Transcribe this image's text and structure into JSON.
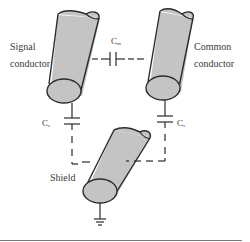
{
  "diagram": {
    "type": "shielded-conductor-capacitance",
    "components": {
      "signal_conductor": {
        "label_line1": "Signal",
        "label_line2": "conductor"
      },
      "common_conductor": {
        "label_line1": "Common",
        "label_line2": "conductor"
      },
      "shield": {
        "label": "Shield"
      }
    },
    "capacitors": {
      "mutual": {
        "symbol": "C",
        "subscript": "m"
      },
      "shield_left": {
        "symbol": "C",
        "subscript": "s"
      },
      "shield_right": {
        "symbol": "C",
        "subscript": "s"
      }
    },
    "ground": {
      "icon": "ground-icon"
    },
    "colors": {
      "conductor_fill": "#c4c4c4",
      "outline": "#2b2b2b",
      "wire": "#2b2b2b",
      "text": "#3a3a3a",
      "rule": "#7a7a7a"
    }
  }
}
